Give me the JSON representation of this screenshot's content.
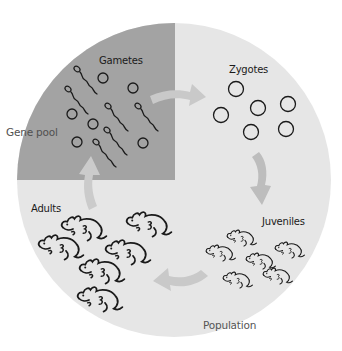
{
  "diagram": {
    "colors": {
      "background": "#ffffff",
      "population_fill": "#e6e6e6",
      "gene_pool_fill": "#a3a3a3",
      "arrow_fill": "#c9c9c9",
      "arrow_fill_dark": "#bdbdbd",
      "ink": "#1a1a1a"
    },
    "regions": {
      "gene_pool_label": "Gene pool",
      "population_label": "Population"
    },
    "stages": [
      {
        "id": "gametes",
        "label": "Gametes"
      },
      {
        "id": "zygotes",
        "label": "Zygotes"
      },
      {
        "id": "juveniles",
        "label": "Juveniles"
      },
      {
        "id": "adults",
        "label": "Adults"
      }
    ],
    "cycle_order": [
      "Gametes",
      "Zygotes",
      "Juveniles",
      "Adults",
      "Gametes"
    ],
    "counts": {
      "eggs": 6,
      "sperm": 6,
      "zygotes": 6,
      "juveniles": 6,
      "adults": 6
    }
  }
}
